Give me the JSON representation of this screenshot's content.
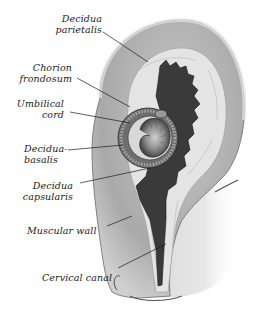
{
  "diagram": {
    "labels": [
      {
        "id": "decidua-parietalis",
        "lines": [
          "Decidua",
          "parietalis"
        ]
      },
      {
        "id": "chorion-frondosum",
        "lines": [
          "Chorion",
          "frondosum"
        ]
      },
      {
        "id": "umbilical-cord",
        "lines": [
          "Umbilical",
          "cord"
        ]
      },
      {
        "id": "decidua-basalis",
        "lines": [
          "Decidua-",
          "basalis"
        ]
      },
      {
        "id": "decidua-capsularis",
        "lines": [
          "Decidua",
          "capsularis"
        ]
      },
      {
        "id": "muscular-wall",
        "lines": [
          "Muscular wall"
        ]
      },
      {
        "id": "cervical-canal",
        "lines": [
          "Cervical canal"
        ]
      }
    ],
    "colors": {
      "background": "#ffffff",
      "muscular_wall": "#b9b9b9",
      "muscular_wall_outer": "#d4d4d4",
      "decidua": "#e6e6e6",
      "cavity": "#3c3c3c",
      "embryo": "#8a8a8a",
      "ink": "#1a1a1a"
    }
  }
}
